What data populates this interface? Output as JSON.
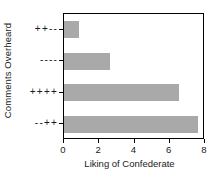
{
  "chart_data": {
    "type": "bar",
    "orientation": "horizontal",
    "title": "",
    "xlabel": "Liking of Confederate",
    "ylabel": "Comments Overheard",
    "categories": [
      "++--",
      "----",
      "++++",
      "--++"
    ],
    "values": [
      0.85,
      2.6,
      6.5,
      7.6
    ],
    "xlim": [
      0,
      8
    ],
    "xticks": [
      "0",
      "2",
      "4",
      "6",
      "8"
    ],
    "xtick_values": [
      0,
      2,
      4,
      6,
      8
    ],
    "grid": false,
    "legend": false,
    "bar_color": "#a9a9a9",
    "frame_color": "#000000",
    "background_color": "#ffffff"
  }
}
